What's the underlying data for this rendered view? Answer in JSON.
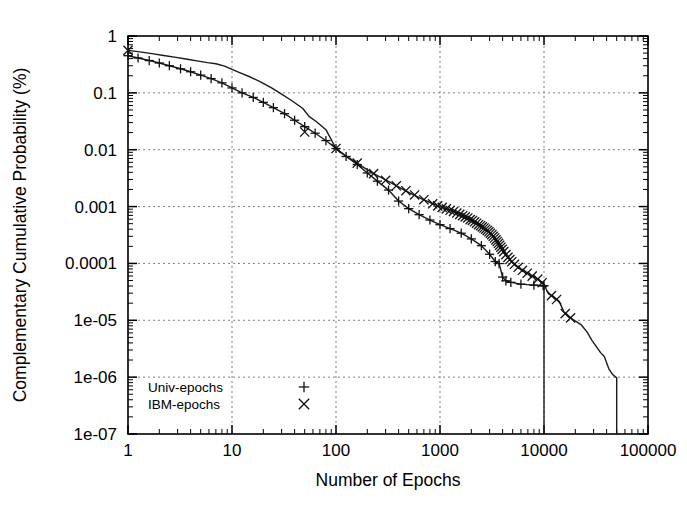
{
  "chart_data": {
    "type": "line",
    "title": "",
    "xlabel": "Number of Epochs",
    "ylabel": "Complementary Cumulative Probability (%)",
    "xscale": "log",
    "yscale": "log",
    "xlim": [
      1,
      100000
    ],
    "ylim": [
      1e-07,
      1
    ],
    "grid": true,
    "legend_position": "bottom-left-inside",
    "x_tick_labels": [
      "1",
      "10",
      "100",
      "1000",
      "10000",
      "100000"
    ],
    "x_tick_values": [
      1,
      10,
      100,
      1000,
      10000,
      100000
    ],
    "y_tick_labels": [
      "1",
      "0.1",
      "0.01",
      "0.001",
      "0.0001",
      "1e-05",
      "1e-06",
      "1e-07"
    ],
    "y_tick_values": [
      1,
      0.1,
      0.01,
      0.001,
      0.0001,
      1e-05,
      1e-06,
      1e-07
    ],
    "series": [
      {
        "name": "Univ-epochs",
        "marker": "+",
        "marker_glyph": "+",
        "points": [
          [
            1,
            0.45
          ],
          [
            1.25,
            0.41
          ],
          [
            1.6,
            0.37
          ],
          [
            2,
            0.335
          ],
          [
            2.5,
            0.3
          ],
          [
            3.2,
            0.265
          ],
          [
            4,
            0.235
          ],
          [
            5,
            0.205
          ],
          [
            6.3,
            0.178
          ],
          [
            8,
            0.15
          ],
          [
            10,
            0.122
          ],
          [
            12.5,
            0.1
          ],
          [
            16,
            0.083
          ],
          [
            20,
            0.068
          ],
          [
            25,
            0.055
          ],
          [
            32,
            0.043
          ],
          [
            40,
            0.033
          ],
          [
            50,
            0.0255
          ],
          [
            63,
            0.0195
          ],
          [
            80,
            0.0145
          ],
          [
            100,
            0.0105
          ],
          [
            125,
            0.0076
          ],
          [
            160,
            0.0055
          ],
          [
            200,
            0.0039
          ],
          [
            250,
            0.0028
          ],
          [
            320,
            0.00195
          ],
          [
            400,
            0.00125
          ],
          [
            500,
            0.00092
          ],
          [
            630,
            0.00072
          ],
          [
            800,
            0.00058
          ],
          [
            1000,
            0.00048
          ],
          [
            1250,
            0.00041
          ],
          [
            1600,
            0.00034
          ],
          [
            2000,
            0.00027
          ],
          [
            2500,
            0.000205
          ],
          [
            3000,
            0.000145
          ],
          [
            3400,
            0.000108
          ],
          [
            3700,
            9.95e-05
          ],
          [
            4000,
            5.75e-05
          ],
          [
            4300,
            4.95e-05
          ],
          [
            4800,
            4.65e-05
          ],
          [
            6000,
            4.32e-05
          ],
          [
            8000,
            4.15e-05
          ],
          [
            9800,
            4.05e-05
          ],
          [
            10000,
            4.05e-05
          ],
          [
            10000,
            1e-07
          ]
        ]
      },
      {
        "name": "IBM-epochs",
        "marker": "x",
        "marker_glyph": "×",
        "points": [
          [
            1,
            0.56
          ],
          [
            1.3,
            0.525
          ],
          [
            1.7,
            0.49
          ],
          [
            2.2,
            0.455
          ],
          [
            2.8,
            0.425
          ],
          [
            3.6,
            0.395
          ],
          [
            4.6,
            0.365
          ],
          [
            5.8,
            0.34
          ],
          [
            7,
            0.325
          ],
          [
            8.5,
            0.295
          ],
          [
            10,
            0.258
          ],
          [
            12,
            0.225
          ],
          [
            15,
            0.19
          ],
          [
            19,
            0.155
          ],
          [
            24,
            0.122
          ],
          [
            30,
            0.095
          ],
          [
            38,
            0.072
          ],
          [
            48,
            0.053
          ],
          [
            55,
            0.0385
          ],
          [
            65,
            0.031
          ],
          [
            80,
            0.0225
          ],
          [
            100,
            0.0105
          ],
          [
            120,
            0.0082
          ],
          [
            145,
            0.0065
          ],
          [
            175,
            0.0052
          ],
          [
            210,
            0.0042
          ],
          [
            255,
            0.00345
          ],
          [
            310,
            0.00285
          ],
          [
            375,
            0.00235
          ],
          [
            450,
            0.00196
          ],
          [
            545,
            0.00164
          ],
          [
            660,
            0.00138
          ],
          [
            800,
            0.00118
          ],
          [
            900,
            0.00108
          ],
          [
            1000,
            0.001
          ],
          [
            1100,
            0.00094
          ],
          [
            1200,
            0.00089
          ],
          [
            1300,
            0.00084
          ],
          [
            1400,
            0.00079
          ],
          [
            1500,
            0.00075
          ],
          [
            1600,
            0.00071
          ],
          [
            1700,
            0.00067
          ],
          [
            1800,
            0.00064
          ],
          [
            1900,
            0.00061
          ],
          [
            2000,
            0.00058
          ],
          [
            2100,
            0.00055
          ],
          [
            2200,
            0.00052
          ],
          [
            2300,
            0.0005
          ],
          [
            2400,
            0.00047
          ],
          [
            2500,
            0.00045
          ],
          [
            2600,
            0.00043
          ],
          [
            2700,
            0.00041
          ],
          [
            2800,
            0.00039
          ],
          [
            2900,
            0.00037
          ],
          [
            3000,
            0.00035
          ],
          [
            3100,
            0.00033
          ],
          [
            3200,
            0.00031
          ],
          [
            3300,
            0.00029
          ],
          [
            3400,
            0.00027
          ],
          [
            3500,
            0.00025
          ],
          [
            3600,
            0.000235
          ],
          [
            3700,
            0.000218
          ],
          [
            3800,
            0.0002
          ],
          [
            3900,
            0.000185
          ],
          [
            4000,
            0.00017
          ],
          [
            4200,
            0.000152
          ],
          [
            4400,
            0.000135
          ],
          [
            4600,
            0.000122
          ],
          [
            4800,
            0.000112
          ],
          [
            5000,
            0.000103
          ],
          [
            5400,
            9.05e-05
          ],
          [
            5900,
            8.05e-05
          ],
          [
            6500,
            7.15e-05
          ],
          [
            7300,
            6.35e-05
          ],
          [
            8200,
            5.65e-05
          ],
          [
            9200,
            4.95e-05
          ],
          [
            10000,
            4.25e-05
          ],
          [
            11000,
            2.95e-05
          ],
          [
            12500,
            2.55e-05
          ],
          [
            14000,
            2.15e-05
          ],
          [
            15500,
            1.42e-05
          ],
          [
            17000,
            1.18e-05
          ],
          [
            19000,
            1.03e-05
          ],
          [
            21000,
            9.2e-06
          ],
          [
            23000,
            8.2e-06
          ],
          [
            26000,
            6.2e-06
          ],
          [
            29000,
            4.4e-06
          ],
          [
            32000,
            3.4e-06
          ],
          [
            35000,
            2.7e-06
          ],
          [
            38000,
            2.3e-06
          ],
          [
            42000,
            1.4e-06
          ],
          [
            46000,
            1.1e-06
          ],
          [
            50000,
            9.7e-07
          ],
          [
            50000,
            1e-07
          ]
        ],
        "marker_points": [
          [
            1,
            0.56
          ],
          [
            50,
            0.0205
          ],
          [
            100,
            0.0105
          ],
          [
            160,
            0.0058
          ],
          [
            230,
            0.0038
          ],
          [
            300,
            0.0029
          ],
          [
            380,
            0.00232
          ],
          [
            470,
            0.0019
          ],
          [
            570,
            0.0016
          ],
          [
            700,
            0.00132
          ],
          [
            850,
            0.00112
          ],
          [
            950,
            0.00103
          ],
          [
            1050,
            0.00097
          ],
          [
            1150,
            0.00091
          ],
          [
            1250,
            0.00086
          ],
          [
            1350,
            0.00082
          ],
          [
            1450,
            0.00077
          ],
          [
            1550,
            0.00073
          ],
          [
            1650,
            0.00069
          ],
          [
            1750,
            0.00066
          ],
          [
            1850,
            0.00063
          ],
          [
            1950,
            0.00059
          ],
          [
            2050,
            0.00057
          ],
          [
            2150,
            0.00054
          ],
          [
            2250,
            0.00051
          ],
          [
            2350,
            0.00048
          ],
          [
            2450,
            0.00046
          ],
          [
            2550,
            0.00044
          ],
          [
            2650,
            0.00042
          ],
          [
            2750,
            0.0004
          ],
          [
            2850,
            0.00038
          ],
          [
            2950,
            0.00036
          ],
          [
            3050,
            0.00034
          ],
          [
            3150,
            0.00032
          ],
          [
            3250,
            0.0003
          ],
          [
            3350,
            0.00028
          ],
          [
            3450,
            0.00026
          ],
          [
            3550,
            0.000243
          ],
          [
            3650,
            0.000226
          ],
          [
            3750,
            0.000209
          ],
          [
            3850,
            0.000193
          ],
          [
            3950,
            0.000177
          ],
          [
            4100,
            0.000161
          ],
          [
            4300,
            0.000143
          ],
          [
            4500,
            0.000128
          ],
          [
            4700,
            0.000117
          ],
          [
            4900,
            0.000107
          ],
          [
            5200,
            9.65e-05
          ],
          [
            5650,
            8.55e-05
          ],
          [
            6200,
            7.58e-05
          ],
          [
            6900,
            6.73e-05
          ],
          [
            7700,
            5.98e-05
          ],
          [
            8700,
            5.3e-05
          ],
          [
            9600,
            4.58e-05
          ],
          [
            11800,
            2.72e-05
          ],
          [
            13200,
            2.32e-05
          ],
          [
            16000,
            1.31e-05
          ],
          [
            18000,
            1.1e-05
          ]
        ]
      }
    ]
  },
  "axes": {
    "x_title": "Number of Epochs",
    "y_title": "Complementary Cumulative Probability (%)"
  },
  "legend": {
    "entries": [
      {
        "label": "Univ-epochs",
        "glyph": "+"
      },
      {
        "label": "IBM-epochs",
        "glyph": "×"
      }
    ]
  },
  "colors": {
    "background": "#ffffff",
    "ink": "#000000",
    "line": "#1a1a1a",
    "grid": "#808080"
  }
}
